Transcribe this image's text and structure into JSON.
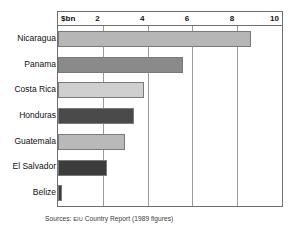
{
  "chart_data": {
    "type": "bar",
    "orientation": "horizontal",
    "title": "",
    "subtitle": "",
    "xlabel": "$bn",
    "ylabel": "",
    "categories": [
      "Nicaragua",
      "Panama",
      "Costa Rica",
      "Honduras",
      "Guatemala",
      "El Salvador",
      "Belize"
    ],
    "values": [
      8.6,
      5.6,
      3.85,
      3.4,
      3.0,
      2.2,
      0.2
    ],
    "series": [
      {
        "name": "External debt",
        "values": [
          8.6,
          5.6,
          3.85,
          3.4,
          3.0,
          2.2,
          0.2
        ]
      }
    ],
    "xlim": [
      0,
      10
    ],
    "xticks": [
      2,
      4,
      6,
      8,
      10
    ],
    "xtick_labels": [
      "2",
      "4",
      "6",
      "8",
      "10"
    ],
    "unit_label": "$bn",
    "grid": true,
    "grid_axis": "x",
    "legend": false,
    "legend_position": "none",
    "bar_colors": [
      "#b6b6b6",
      "#8a8a8a",
      "#cfcfcf",
      "#4a4a4a",
      "#b9b9b9",
      "#3c3c3c",
      "#3c3c3c"
    ],
    "annotations": []
  },
  "caption": {
    "prefix": "Sources:",
    "source_abbr": "eiu",
    "suffix": "Country Report (1989 figures)"
  },
  "colors": {
    "frame": "#6f6f6f",
    "gridline": "#9a9a9a",
    "text": "#111111",
    "caption_text": "#3a3a3a",
    "background": "#ffffff"
  }
}
